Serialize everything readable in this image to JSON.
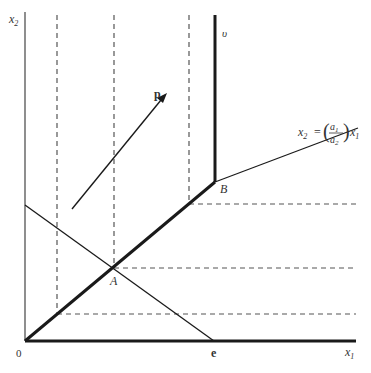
{
  "figure": {
    "axes": {
      "x_label": "x",
      "x_label_sub": "1",
      "y_label": "x",
      "y_label_sub": "2",
      "origin_label": "0"
    },
    "points": {
      "A": "A",
      "B": "B",
      "e": "e"
    },
    "vector_label": "p",
    "curve_label": "υ",
    "line_equation": {
      "lhs": "x",
      "lhs_sub": "2",
      "equals": "=",
      "num": "a",
      "num_sub": "1",
      "den": "a",
      "den_sub": "2",
      "rhs": "x",
      "rhs_sub": "1"
    },
    "colors": {
      "line": "#1a1a1a",
      "dashed": "#555555",
      "text": "#333333"
    }
  }
}
